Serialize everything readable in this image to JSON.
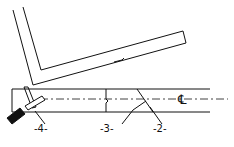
{
  "labels": {
    "part2": "-2-",
    "part3": "-3-",
    "part4": "-4-",
    "centerline": "℄"
  },
  "colors": {
    "ink": "#111111",
    "background": "#ffffff"
  }
}
